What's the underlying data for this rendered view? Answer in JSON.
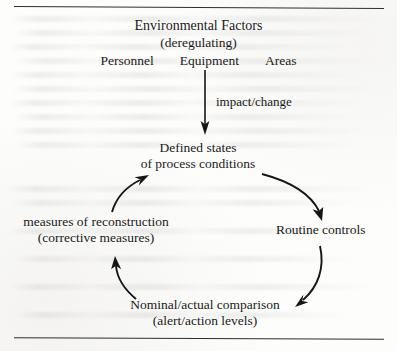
{
  "figure": {
    "type": "cycle-flow-diagram",
    "medium": "scanned-book-page",
    "ink_color": "#161616",
    "paper_color": "#fdfdfc"
  },
  "input_block": {
    "title": "Environmental Factors",
    "subtitle": "(deregulating)",
    "factors": [
      {
        "label": "Personnel"
      },
      {
        "label": "Equipment"
      },
      {
        "label": "Areas"
      }
    ]
  },
  "input_arrow": {
    "label": "impact/change",
    "direction": "down"
  },
  "cycle": {
    "direction": "clockwise",
    "nodes": [
      {
        "id": "defined-states",
        "line1": "Defined states",
        "line2": "of process conditions",
        "position": "top"
      },
      {
        "id": "routine-controls",
        "line1": "Routine controls",
        "line2": "",
        "position": "right"
      },
      {
        "id": "nominal-actual",
        "line1": "Nominal/actual comparison",
        "line2": "(alert/action levels)",
        "position": "bottom"
      },
      {
        "id": "measures-reconstruction",
        "line1": "measures of reconstruction",
        "line2": "(corrective measures)",
        "position": "left"
      }
    ],
    "edges": [
      {
        "id": "edge-defined-to-routine",
        "from": "defined-states",
        "to": "routine-controls"
      },
      {
        "id": "edge-routine-to-nominal",
        "from": "routine-controls",
        "to": "nominal-actual"
      },
      {
        "id": "edge-nominal-to-measures",
        "from": "nominal-actual",
        "to": "measures-reconstruction"
      },
      {
        "id": "edge-measures-to-defined",
        "from": "measures-reconstruction",
        "to": "defined-states"
      }
    ]
  }
}
